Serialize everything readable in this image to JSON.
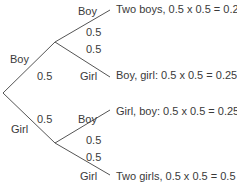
{
  "first_child": {
    "boy": {
      "label": "Boy",
      "probability": "0.5"
    },
    "girl": {
      "label": "Girl",
      "probability": "0.5"
    }
  },
  "second_child": {
    "after_boy": {
      "boy": {
        "label": "Boy",
        "probability": "0.5"
      },
      "girl": {
        "label": "Girl",
        "probability": "0.5"
      }
    },
    "after_girl": {
      "boy": {
        "label": "Boy",
        "probability": "0.5"
      },
      "girl": {
        "label": "Girl",
        "probability": "0.5"
      }
    }
  },
  "outcomes": [
    "Two boys, 0.5 x 0.5 = 0.25",
    "Boy, girl: 0.5 x 0.5 = 0.25",
    "Girl, boy: 0.5 x 0.5 = 0.25",
    "Two girls, 0.5 x 0.5 = 0.5"
  ],
  "colors": {
    "line": "#555555",
    "text": "#3a3a3a"
  }
}
